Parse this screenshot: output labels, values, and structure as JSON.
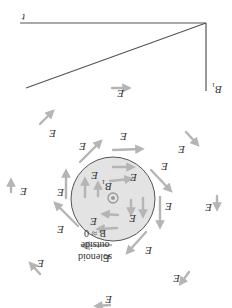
{
  "figure": {
    "orientation": "rotated-180",
    "graph": {
      "x_axis_label": "t",
      "y_axis_label": "B",
      "y_axis_subscript": "1",
      "line_description": "B decreasing linearly with t from B1 to 0"
    },
    "solenoid": {
      "field_label": "B",
      "field_subscript": "1",
      "field_direction_symbol": "⊙",
      "fill_color": "#e3e3e3",
      "stroke_color": "#555555"
    },
    "outside_note": {
      "line1": "B ≈ 0",
      "line2": "outside",
      "line3": "solenoid"
    },
    "vector_label": "E",
    "arrow_color": "#b5b5b5"
  }
}
